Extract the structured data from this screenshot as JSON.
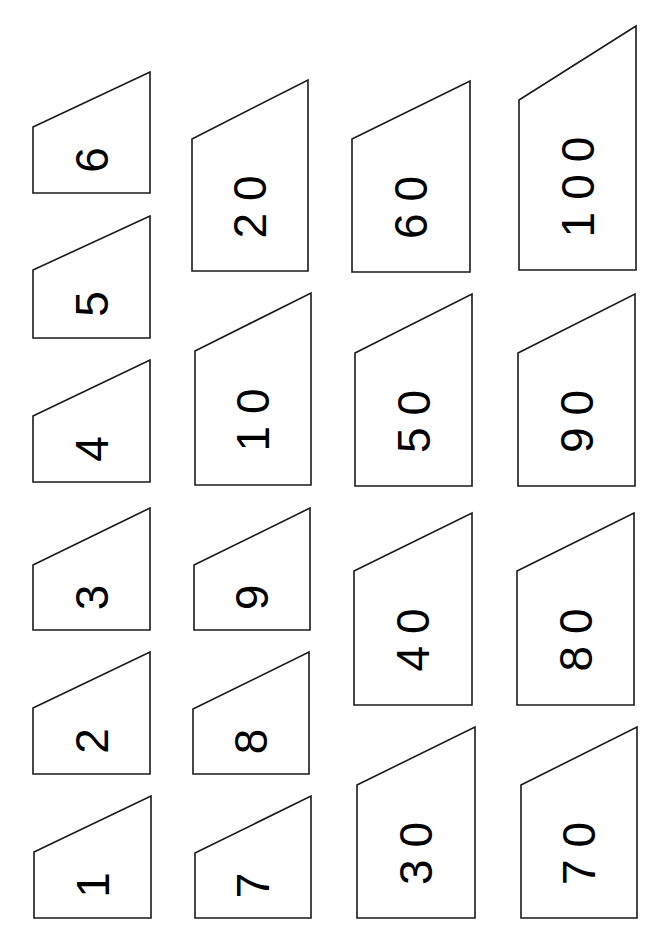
{
  "sheet": {
    "background": "#ffffff",
    "stroke_color": "#1a1a1a",
    "text_color": "#000000",
    "text_rotation_deg": -90
  },
  "cards": [
    {
      "label": "6",
      "x1": 33,
      "x2": 150,
      "top_left": 127,
      "top_right": 72,
      "bottom": 193
    },
    {
      "label": "5",
      "x1": 33,
      "x2": 150,
      "top_left": 270,
      "top_right": 216,
      "bottom": 338
    },
    {
      "label": "4",
      "x1": 33,
      "x2": 150,
      "top_left": 416,
      "top_right": 360,
      "bottom": 482
    },
    {
      "label": "3",
      "x1": 33,
      "x2": 150,
      "top_left": 565,
      "top_right": 508,
      "bottom": 630
    },
    {
      "label": "2",
      "x1": 33,
      "x2": 150,
      "top_left": 708,
      "top_right": 652,
      "bottom": 774
    },
    {
      "label": "1",
      "x1": 34,
      "x2": 151,
      "top_left": 852,
      "top_right": 796,
      "bottom": 918
    },
    {
      "label": "20",
      "x1": 192,
      "x2": 308,
      "top_left": 139,
      "top_right": 80,
      "bottom": 271
    },
    {
      "label": "10",
      "x1": 195,
      "x2": 311,
      "top_left": 351,
      "top_right": 293,
      "bottom": 485
    },
    {
      "label": "9",
      "x1": 194,
      "x2": 310,
      "top_left": 565,
      "top_right": 508,
      "bottom": 630
    },
    {
      "label": "8",
      "x1": 193,
      "x2": 309,
      "top_left": 709,
      "top_right": 652,
      "bottom": 774
    },
    {
      "label": "7",
      "x1": 195,
      "x2": 311,
      "top_left": 853,
      "top_right": 796,
      "bottom": 918
    },
    {
      "label": "60",
      "x1": 352,
      "x2": 470,
      "top_left": 139,
      "top_right": 81,
      "bottom": 272
    },
    {
      "label": "50",
      "x1": 355,
      "x2": 472,
      "top_left": 353,
      "top_right": 294,
      "bottom": 486
    },
    {
      "label": "40",
      "x1": 354,
      "x2": 472,
      "top_left": 571,
      "top_right": 513,
      "bottom": 705
    },
    {
      "label": "30",
      "x1": 357,
      "x2": 475,
      "top_left": 785,
      "top_right": 727,
      "bottom": 918
    },
    {
      "label": "100",
      "x1": 519,
      "x2": 636,
      "top_left": 100,
      "top_right": 26,
      "bottom": 270
    },
    {
      "label": "90",
      "x1": 518,
      "x2": 635,
      "top_left": 353,
      "top_right": 294,
      "bottom": 486
    },
    {
      "label": "80",
      "x1": 517,
      "x2": 634,
      "top_left": 571,
      "top_right": 513,
      "bottom": 705
    },
    {
      "label": "70",
      "x1": 521,
      "x2": 637,
      "top_left": 785,
      "top_right": 727,
      "bottom": 918
    }
  ]
}
